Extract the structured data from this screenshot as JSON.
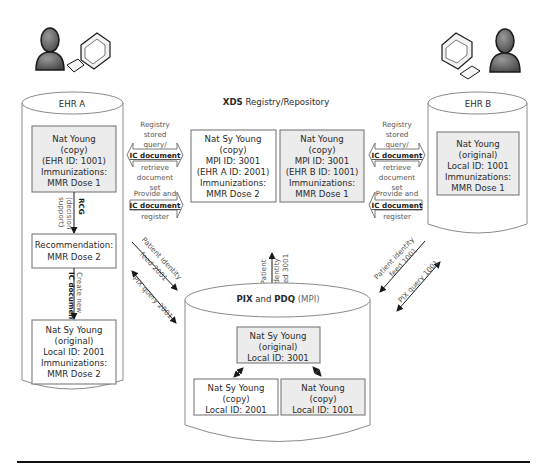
{
  "ehr_a": {
    "title": "EHR A",
    "box1": [
      "Nat Young",
      "(copy)",
      "(EHR ID: 1001)",
      "Immunizations:",
      "MMR Dose 1"
    ],
    "rcg_label_bold": "RCG",
    "rcg_label_sub": [
      "(decision",
      "support)"
    ],
    "recommendation": [
      "Recommendation:",
      "MMR Dose 2"
    ],
    "create_label_normal": "Create new",
    "create_label_bold": "IC document",
    "box3": [
      "Nat Sy Young",
      "(original)",
      "Local ID: 2001",
      "Immunizations:",
      "MMR Dose 2"
    ]
  },
  "ehr_b": {
    "title": "EHR B",
    "box1": [
      "Nat Young",
      "(original)",
      "Local ID: 1001",
      "Immunizations:",
      "MMR Dose 1"
    ]
  },
  "xds": {
    "title_bold": "XDS",
    "title_rest": " Registry/Repository",
    "box_left": [
      "Nat Sy Young",
      "(copy)",
      "MPI ID: 3001",
      "(EHR A ID: 2001)",
      "Immunizations:",
      "MMR Dose 2"
    ],
    "box_right": [
      "Nat  Young",
      "(copy)",
      "MPI ID: 3001",
      "(EHR B ID: 1001)",
      "Immunizations:",
      "MMR Dose 1"
    ]
  },
  "transactions": {
    "query_top": [
      "Registry",
      "stored",
      "query/"
    ],
    "query_doc": "IC document",
    "query_bottom": [
      "retrieve",
      "document",
      "set"
    ],
    "provide_top": "Provide and",
    "provide_doc": "IC document",
    "provide_bottom": "register"
  },
  "pix": {
    "title_bold_1": "PIX",
    "title_and": " and ",
    "title_bold_2": "PDQ",
    "title_rest": " (MPI)",
    "box_top": [
      "Nat  Sy Young",
      "(original)",
      "Local ID: 3001"
    ],
    "box_left": [
      "Nat Sy Young",
      "(copy)",
      "Local ID: 2001"
    ],
    "box_right": [
      "Nat Young",
      "(copy)",
      "Local ID: 1001"
    ]
  },
  "feeds": {
    "left_feed": [
      "Patient identity",
      "feed 2001"
    ],
    "left_query": "PIX query 2001",
    "right_feed": [
      "Patient identity",
      "feed 1001"
    ],
    "right_query": "PIX query 1001",
    "center_feed": [
      "Patient",
      "identity",
      "feed 3001"
    ]
  },
  "actors": {
    "left": {
      "icon": "user-computer-icon"
    },
    "right": {
      "icon": "user-computer-icon"
    }
  },
  "colors": {
    "box_fill": "#ececec",
    "stroke": "#7a7a7a",
    "text": "#2a2a2a"
  }
}
